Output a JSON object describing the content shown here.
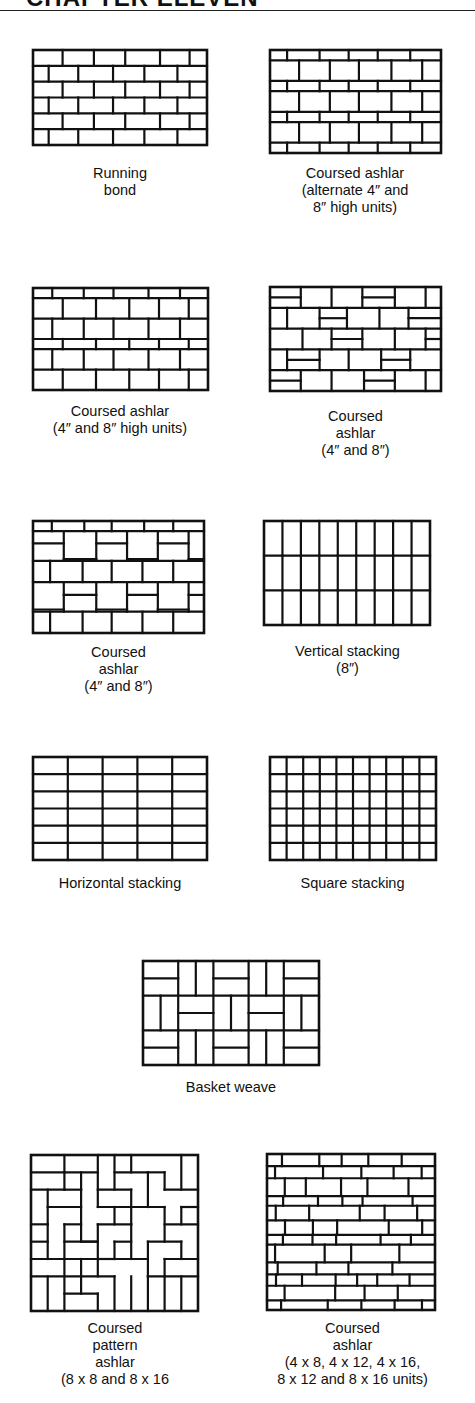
{
  "header": {
    "title": "CHAPTER ELEVEN"
  },
  "colors": {
    "ink": "#111111",
    "paper": "#ffffff"
  },
  "figures": [
    {
      "id": "running-bond",
      "caption": "Running\nbond",
      "box": [
        33,
        50,
        174,
        95
      ],
      "caption_pos": [
        33,
        165,
        174
      ]
    },
    {
      "id": "coursed-ashlar-alternate",
      "caption": "Coursed ashlar\n(alternate 4″ and\n8″ high units)",
      "box": [
        270,
        50,
        171,
        103
      ],
      "caption_pos": [
        255,
        165,
        200
      ]
    },
    {
      "id": "coursed-ashlar-4-8-high",
      "caption": "Coursed ashlar\n(4″ and 8″ high units)",
      "box": [
        33,
        288,
        175,
        102
      ],
      "caption_pos": [
        20,
        403,
        200
      ]
    },
    {
      "id": "coursed-ashlar-4-8-a",
      "caption": "Coursed\nashlar\n(4″ and 8″)",
      "box": [
        270,
        287,
        171,
        104
      ],
      "caption_pos": [
        270,
        408,
        171
      ]
    },
    {
      "id": "coursed-ashlar-4-8-b",
      "caption": "Coursed\nashlar\n(4″ and 8″)",
      "box": [
        33,
        521,
        171,
        112
      ],
      "caption_pos": [
        33,
        644,
        171
      ]
    },
    {
      "id": "vertical-stacking",
      "caption": "Vertical stacking\n(8″)",
      "box": [
        264,
        521,
        166,
        104
      ],
      "caption_pos": [
        255,
        643,
        185
      ]
    },
    {
      "id": "horizontal-stacking",
      "caption": "Horizontal stacking",
      "box": [
        33,
        757,
        174,
        103
      ],
      "caption_pos": [
        20,
        875,
        200
      ]
    },
    {
      "id": "square-stacking",
      "caption": "Square stacking",
      "box": [
        270,
        757,
        166,
        103
      ],
      "caption_pos": [
        260,
        875,
        185
      ]
    },
    {
      "id": "basket-weave",
      "caption": "Basket weave",
      "box": [
        143,
        961,
        176,
        104
      ],
      "caption_pos": [
        143,
        1079,
        176
      ]
    },
    {
      "id": "coursed-pattern-ashlar",
      "caption": "Coursed\npattern\nashlar\n(8 x 8 and 8 x 16",
      "box": [
        31,
        1155,
        167,
        156
      ],
      "caption_pos": [
        15,
        1320,
        200
      ]
    },
    {
      "id": "coursed-ashlar-mixed-units",
      "caption": "Coursed\nashlar\n(4 x 8, 4 x 12, 4 x 16,\n8 x 12 and 8 x 16 units)",
      "box": [
        267,
        1154,
        168,
        156
      ],
      "caption_pos": [
        245,
        1320,
        215
      ]
    }
  ]
}
